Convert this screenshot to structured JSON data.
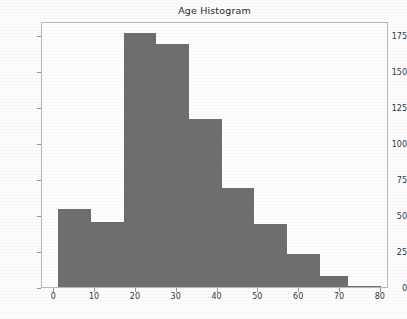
{
  "chart_data": {
    "type": "bar",
    "title": "Age Histogram",
    "xlabel": "",
    "ylabel": "",
    "xlim": [
      -3,
      82
    ],
    "ylim": [
      0,
      185
    ],
    "grid": false,
    "legend": null,
    "bar_color": "#6f6f6f",
    "axes_color": "#b9b9b9",
    "text_color": "#353535",
    "background_color": "#fefefe",
    "xticks": [
      0,
      10,
      20,
      30,
      40,
      50,
      60,
      70,
      80
    ],
    "xtick_labels": [
      "0",
      "10",
      "20",
      "30",
      "40",
      "50",
      "60",
      "70",
      "80"
    ],
    "yticks": [
      0,
      25,
      50,
      75,
      100,
      125,
      150,
      175
    ],
    "ytick_labels": [
      "0",
      "25",
      "50",
      "75",
      "100",
      "125",
      "150",
      "175"
    ],
    "bin_edges": [
      1,
      9,
      17,
      25,
      33,
      41,
      49,
      57,
      65,
      72,
      80
    ],
    "bins": [
      {
        "x0": 1,
        "x1": 9,
        "count": 54,
        "label": "1-9"
      },
      {
        "x0": 9,
        "x1": 17,
        "count": 45,
        "label": "9-17"
      },
      {
        "x0": 17,
        "x1": 25,
        "count": 177,
        "label": "17-25"
      },
      {
        "x0": 25,
        "x1": 33,
        "count": 169,
        "label": "25-33"
      },
      {
        "x0": 33,
        "x1": 41,
        "count": 117,
        "label": "33-41"
      },
      {
        "x0": 41,
        "x1": 49,
        "count": 69,
        "label": "41-49"
      },
      {
        "x0": 49,
        "x1": 57,
        "count": 44,
        "label": "49-57"
      },
      {
        "x0": 57,
        "x1": 65,
        "count": 23,
        "label": "57-65"
      },
      {
        "x0": 65,
        "x1": 72,
        "count": 8,
        "label": "65-72"
      },
      {
        "x0": 72,
        "x1": 80,
        "count": 1,
        "label": "72-80"
      }
    ],
    "categories": [
      "1-9",
      "9-17",
      "17-25",
      "25-33",
      "33-41",
      "41-49",
      "49-57",
      "57-65",
      "65-72",
      "72-80"
    ],
    "values": [
      54,
      45,
      177,
      169,
      117,
      69,
      44,
      23,
      8,
      1
    ]
  }
}
